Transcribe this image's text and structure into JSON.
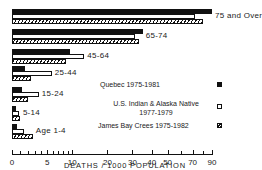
{
  "chart_data": {
    "type": "bar",
    "orientation": "horizontal",
    "title": "",
    "xlabel": "DEATHS / 1000 POPULATION",
    "ylabel": "",
    "x_scale": "log(x+10)",
    "xlim": [
      0,
      90
    ],
    "x_ticks": [
      0,
      5,
      10,
      20,
      30,
      40,
      50,
      70,
      90
    ],
    "x_tick_labels": [
      "0",
      "5",
      "10",
      "20",
      "30",
      "40",
      "50",
      "70",
      "90"
    ],
    "grid": false,
    "legend_position": "right",
    "categories": [
      "75 and Over",
      "65-74",
      "45-64",
      "25-44",
      "15-24",
      "5-14",
      "Age 1-4"
    ],
    "series": [
      {
        "name": "Quebec 1975-1981",
        "fill": "solid-black",
        "values": [
          90,
          35,
          9.5,
          1.6,
          1.2,
          0.5,
          0.6
        ]
      },
      {
        "name": "U.S. Indian & Alaska Native 1977-1979",
        "fill": "white",
        "values": [
          72,
          31,
          13,
          5.8,
          3.6,
          0.8,
          1.5
        ]
      },
      {
        "name": "James Bay Crees 1975-1982",
        "fill": "hatched",
        "values": [
          80,
          33,
          8.6,
          2.4,
          2.0,
          0.95,
          2.7
        ]
      }
    ]
  },
  "legend": [
    {
      "line1": "Quebec 1975-1981",
      "line2": ""
    },
    {
      "line1": "U.S. Indian & Alaska Native",
      "line2": "1977-1979"
    },
    {
      "line1": "James Bay Crees 1975-1982",
      "line2": ""
    }
  ]
}
